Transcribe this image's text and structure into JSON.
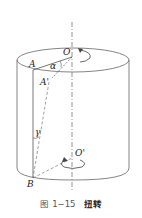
{
  "figure": {
    "labels": {
      "O": "O",
      "O_prime": "O'",
      "A": "A",
      "A_prime": "A'",
      "B": "B",
      "alpha": "α",
      "gamma": "γ"
    },
    "caption": {
      "number": "图 1−15",
      "title": "扭转"
    },
    "colors": {
      "line": "#555555",
      "text": "#222222"
    }
  }
}
